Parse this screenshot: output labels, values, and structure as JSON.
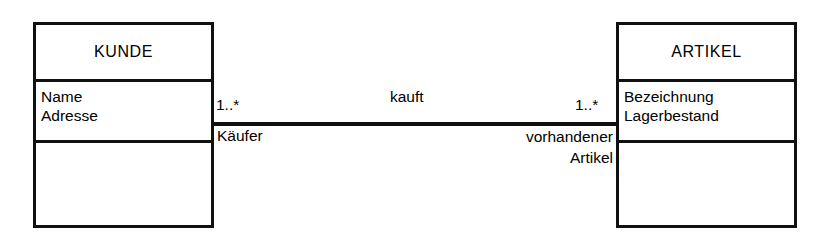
{
  "diagram": {
    "type": "uml-class-diagram",
    "background_color": "#ffffff",
    "line_color": "#111111"
  },
  "classes": [
    {
      "name": "KUNDE",
      "attributes": [
        "Name",
        "Adresse"
      ],
      "operations": []
    },
    {
      "name": "ARTIKEL",
      "attributes": [
        "Bezeichnung",
        "Lagerbestand"
      ],
      "operations": []
    }
  ],
  "association": {
    "name": "kauft",
    "source": {
      "multiplicity": "1..*",
      "role": "Käufer"
    },
    "target": {
      "multiplicity": "1..*",
      "role_line1": "vorhandener",
      "role_line2": "Artikel"
    }
  }
}
